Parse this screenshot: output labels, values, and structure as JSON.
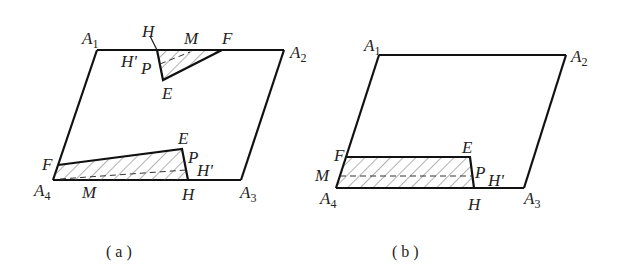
{
  "figure_a": {
    "caption": "( a )",
    "labels": {
      "A1": "A",
      "A1_sub": "1",
      "A2": "A",
      "A2_sub": "2",
      "A3": "A",
      "A3_sub": "3",
      "A4": "A",
      "A4_sub": "4",
      "top_H": "H",
      "top_M": "M",
      "top_F": "F",
      "top_Hp": "H'",
      "top_P": "P",
      "top_E": "E",
      "bot_E": "E",
      "bot_F": "F",
      "bot_M": "M",
      "bot_H": "H",
      "bot_P": "P",
      "bot_Hp": "H'"
    }
  },
  "figure_b": {
    "caption": "( b )",
    "labels": {
      "A1": "A",
      "A1_sub": "1",
      "A2": "A",
      "A2_sub": "2",
      "A3": "A",
      "A3_sub": "3",
      "A4": "A",
      "A4_sub": "4",
      "F": "F",
      "E": "E",
      "M": "M",
      "P": "P",
      "Hp": "H'",
      "H": "H"
    }
  },
  "colors": {
    "line": "#111111",
    "hatch": "#555555",
    "background": "#ffffff"
  }
}
